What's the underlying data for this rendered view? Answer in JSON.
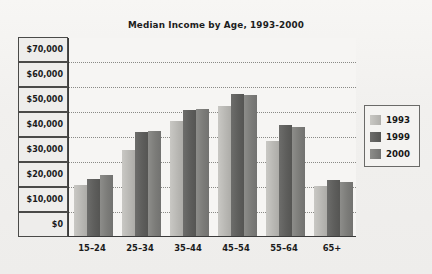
{
  "chart_data": {
    "type": "bar",
    "title": "Median Income by Age, 1993-2000",
    "xlabel": "",
    "ylabel": "",
    "categories": [
      "15–24",
      "25–34",
      "35–44",
      "45–54",
      "55–64",
      "65+"
    ],
    "series": [
      {
        "name": "1993",
        "color": "#b9b8b4",
        "values": [
          20500,
          34500,
          46000,
          52000,
          38000,
          20200
        ]
      },
      {
        "name": "1999",
        "color": "#5e5e5c",
        "values": [
          23000,
          41500,
          50500,
          57000,
          44500,
          22500
        ]
      },
      {
        "name": "2000",
        "color": "#7c7c79",
        "values": [
          24500,
          42000,
          51000,
          56500,
          43500,
          21800
        ]
      }
    ],
    "ylim": [
      0,
      70000
    ],
    "ytick_values": [
      0,
      10000,
      20000,
      30000,
      40000,
      50000,
      60000,
      70000
    ],
    "ytick_labels": [
      "$0",
      "$10,000",
      "$20,000",
      "$30,000",
      "$40,000",
      "$50,000",
      "$60,000",
      "$70,000"
    ],
    "grid": true,
    "grid_style": "dotted-horizontal",
    "legend_position": "right"
  },
  "legend": {
    "entries": [
      {
        "label": "1993"
      },
      {
        "label": "1999"
      },
      {
        "label": "2000"
      }
    ]
  },
  "colors": {
    "series_1993": "#b9b8b4",
    "series_1999": "#5e5e5c",
    "series_2000": "#7c7c79",
    "axis": "#3b3b3b",
    "gridline": "#8a8a86",
    "background": "#f1f0ee"
  }
}
